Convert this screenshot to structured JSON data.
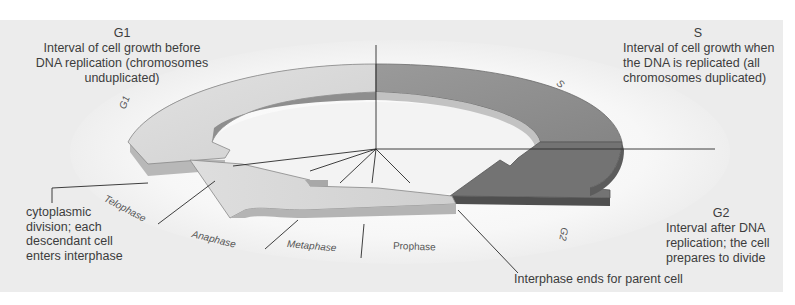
{
  "diagram": {
    "colors": {
      "background_panel": "#ececec",
      "plate": "#f6f6f6",
      "g1_ring": "#d9d9d9",
      "s_ring": "#8f8f8f",
      "g2_arrow": "#6f6f6f",
      "mitosis_arrow": "#d4d4d4"
    },
    "callouts": {
      "g1": {
        "title": "G1",
        "lines": [
          "Interval of cell growth before",
          "DNA replication (chromosomes",
          "unduplicated)"
        ]
      },
      "s": {
        "title": "S",
        "lines": [
          "Interval of cell growth when",
          "the DNA is replicated (all",
          "chromosomes duplicated)"
        ]
      },
      "g2": {
        "title": "G2",
        "lines": [
          "Interval after DNA",
          "replication; the cell",
          "prepares to divide"
        ]
      },
      "cytokinesis": {
        "lines": [
          "cytoplasmic",
          "division; each",
          "descendant cell",
          "enters interphase"
        ]
      },
      "interphase_end": {
        "text": "Interphase ends for parent cell"
      }
    },
    "ring_labels": {
      "g1": "G1",
      "s": "S",
      "g2": "G2"
    },
    "mitosis_phases": [
      "Telophase",
      "Anaphase",
      "Metaphase",
      "Prophase"
    ]
  }
}
